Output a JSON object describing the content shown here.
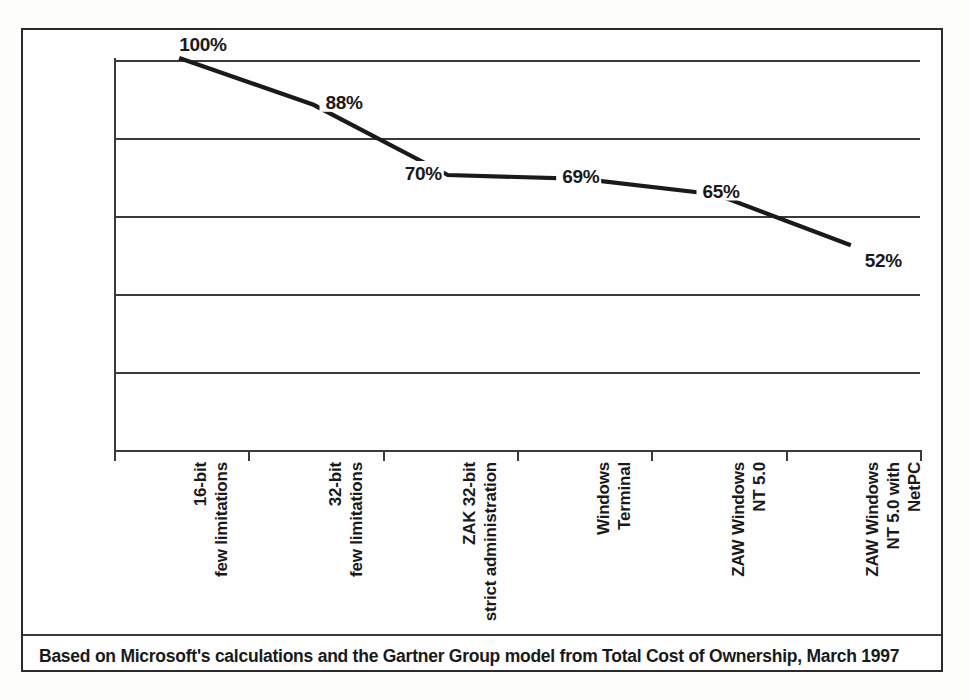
{
  "chart_data": {
    "type": "line",
    "title": "",
    "subtitle": "",
    "xlabel": "",
    "ylabel": "",
    "ylim": [
      0,
      100
    ],
    "yticks": [
      "0%",
      "20%",
      "40%",
      "60%",
      "80%",
      "100%"
    ],
    "ytick_values": [
      0,
      20,
      40,
      60,
      80,
      100
    ],
    "grid": true,
    "legend": "none",
    "categories": [
      "16-bit\nfew limitations",
      "32-bit\nfew limitations",
      "ZAK 32-bit\nstrict administration",
      "Windows\nTerminal",
      "ZAW Windows\nNT 5.0",
      "ZAW Windows\nNT 5.0 with\nNetPC"
    ],
    "values": [
      100,
      88,
      70,
      69,
      65,
      52
    ],
    "point_labels": [
      "100%",
      "88%",
      "70%",
      "69%",
      "65%",
      "52%"
    ],
    "series": [
      {
        "name": "Total cost of ownership",
        "values": [
          100,
          88,
          70,
          69,
          65,
          52
        ]
      }
    ],
    "annotations": [],
    "line_color": "#1a1a1a",
    "grid_color": "#3a3a3a"
  },
  "caption": {
    "text": "Based on Microsoft's calculations and the Gartner Group model from Total Cost of Ownership, March 1997"
  }
}
